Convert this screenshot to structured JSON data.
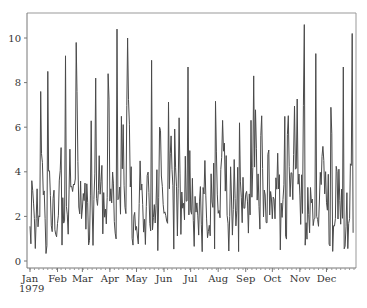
{
  "chart_data": {
    "type": "line",
    "title": "",
    "xlabel": "",
    "ylabel": "",
    "year_label": "1979",
    "x_tick_labels": [
      "Jan",
      "Feb",
      "Mar",
      "Apr",
      "May",
      "Jun",
      "Jul",
      "Aug",
      "Sep",
      "Oct",
      "Nov",
      "Dec"
    ],
    "y_tick_labels": [
      "0",
      "2",
      "4",
      "6",
      "8",
      "10"
    ],
    "y_ticks": [
      0,
      2,
      4,
      6,
      8,
      10
    ],
    "ylim": [
      -0.15,
      11.1
    ],
    "xlim": [
      0,
      365
    ],
    "grid": false,
    "legend": null,
    "series_color": "#4a4a4a",
    "frame_color": "#999999",
    "month_start_days": [
      0,
      31,
      59,
      90,
      120,
      151,
      181,
      212,
      243,
      273,
      304,
      334
    ],
    "x_description": "Daily values, Jan 1 1979 – Dec 31 1979 (365 points)",
    "series": [
      {
        "name": "daily",
        "peaks": [
          {
            "day": 20,
            "value": 8.5
          },
          {
            "day": 40,
            "value": 9.2
          },
          {
            "day": 52,
            "value": 9.8
          },
          {
            "day": 74,
            "value": 8.2
          },
          {
            "day": 88,
            "value": 8.4
          },
          {
            "day": 98,
            "value": 10.4
          },
          {
            "day": 110,
            "value": 10.0
          },
          {
            "day": 137,
            "value": 9.0
          },
          {
            "day": 178,
            "value": 8.7
          },
          {
            "day": 252,
            "value": 8.3
          },
          {
            "day": 309,
            "value": 10.6
          },
          {
            "day": 322,
            "value": 9.3
          },
          {
            "day": 353,
            "value": 8.7
          },
          {
            "day": 363,
            "value": 10.2
          }
        ],
        "value_range": [
          0.2,
          10.6
        ],
        "typical_mean": 3.0
      }
    ]
  },
  "caption": ""
}
